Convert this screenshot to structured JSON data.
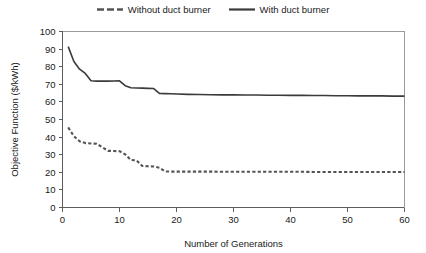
{
  "chart_data": {
    "type": "line",
    "title": "",
    "xlabel": "Number of Generations",
    "ylabel": "Objective Function ($/kWh)",
    "xlim": [
      0,
      60
    ],
    "ylim": [
      0,
      100
    ],
    "xticks": [
      "0",
      "10",
      "20",
      "30",
      "40",
      "50",
      "60"
    ],
    "yticks": [
      "0",
      "10",
      "20",
      "30",
      "40",
      "50",
      "60",
      "70",
      "80",
      "90",
      "100"
    ],
    "grid": false,
    "legend_position": "top-center",
    "x": [
      1,
      2,
      3,
      4,
      5,
      6,
      7,
      8,
      9,
      10,
      11,
      12,
      13,
      14,
      15,
      16,
      17,
      18,
      19,
      20,
      22,
      24,
      26,
      28,
      30,
      32,
      34,
      36,
      38,
      40,
      42,
      44,
      46,
      48,
      50,
      52,
      54,
      56,
      58,
      60
    ],
    "series": [
      {
        "name": "Without duct burner",
        "style": "dashed",
        "color": "#555555",
        "values": [
          45.5,
          40.5,
          37.6,
          36.6,
          36.4,
          36.2,
          34.2,
          32.2,
          32.1,
          32.0,
          30.2,
          27.0,
          26.8,
          23.6,
          23.4,
          23.3,
          22.6,
          20.5,
          20.4,
          20.4,
          20.4,
          20.4,
          20.4,
          20.3,
          20.3,
          20.3,
          20.3,
          20.3,
          20.3,
          20.3,
          20.3,
          20.2,
          20.2,
          20.2,
          20.2,
          20.2,
          20.2,
          20.2,
          20.2,
          20.2
        ]
      },
      {
        "name": "With duct burner",
        "style": "solid",
        "color": "#3b3b3b",
        "values": [
          91.4,
          83.0,
          78.6,
          76.2,
          72.0,
          71.8,
          71.8,
          71.8,
          71.9,
          72.0,
          69.2,
          68.0,
          67.9,
          67.8,
          67.7,
          67.6,
          64.8,
          64.7,
          64.6,
          64.5,
          64.3,
          64.2,
          64.1,
          64.0,
          64.0,
          63.9,
          63.9,
          63.8,
          63.8,
          63.7,
          63.7,
          63.6,
          63.6,
          63.5,
          63.5,
          63.4,
          63.4,
          63.4,
          63.3,
          63.3
        ]
      }
    ]
  },
  "legend": {
    "entries": [
      {
        "label": "Without duct burner"
      },
      {
        "label": "With duct burner"
      }
    ]
  }
}
